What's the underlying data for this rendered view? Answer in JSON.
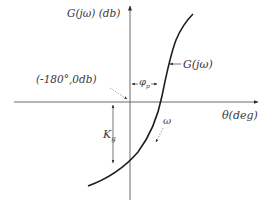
{
  "diagram": {
    "type": "nichols-chart-stability-margins",
    "y_axis_label": "G(jω) (db)",
    "x_axis_label": "θ(deg)",
    "critical_point_label": "(-180°,0db)",
    "curve_label": "G(jω)",
    "phase_margin_label": "φ",
    "phase_margin_subscript": "p",
    "gain_margin_label": "K",
    "gain_margin_subscript": "g",
    "frequency_label": "ω"
  }
}
